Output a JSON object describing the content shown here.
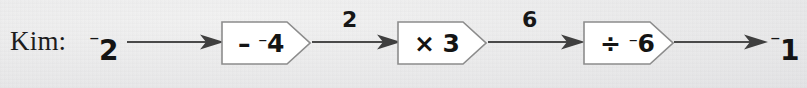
{
  "diagram": {
    "type": "function-machine-flow",
    "person_label": "Kim:",
    "start_value": {
      "sign": "⁻",
      "number": "2",
      "full": "⁻2"
    },
    "end_value": {
      "sign": "⁻",
      "number": "1",
      "full": "⁻1"
    },
    "machines": [
      {
        "id": "subtract-neg-4",
        "operator": "–",
        "operand_sign": "⁻",
        "operand": "4",
        "full": "– ⁻4"
      },
      {
        "id": "multiply-3",
        "operator": "×",
        "operand_sign": "",
        "operand": "3",
        "full": "× 3"
      },
      {
        "id": "divide-neg-6",
        "operator": "÷",
        "operand_sign": "⁻",
        "operand": "6",
        "full": "÷ ⁻6"
      }
    ],
    "edge_labels": [
      {
        "id": "after-machine-1",
        "value": "2"
      },
      {
        "id": "after-machine-2",
        "value": "6"
      }
    ],
    "arrows": [
      {
        "id": "arrow-start-to-machine-1"
      },
      {
        "id": "arrow-machine-1-to-machine-2"
      },
      {
        "id": "arrow-machine-2-to-machine-3"
      },
      {
        "id": "arrow-machine-3-to-end"
      }
    ],
    "colors": {
      "background": "#ececec",
      "ink": "#141414",
      "arrow": "#454545",
      "box_fill": "#ffffff",
      "box_stroke": "#8a8a8a"
    }
  }
}
